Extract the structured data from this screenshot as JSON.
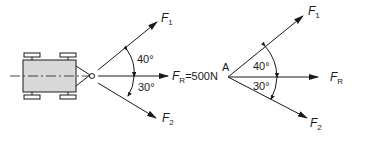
{
  "left_diagram": {
    "description": "Vehicle pulled by two forces",
    "forces": {
      "F1": {
        "label": "F",
        "sub": "1"
      },
      "F2": {
        "label": "F",
        "sub": "2"
      },
      "FR": {
        "label": "F",
        "sub": "R",
        "value": "=500N"
      }
    },
    "angles": {
      "upper": "40°",
      "lower": "30°"
    }
  },
  "right_diagram": {
    "point_label": "A",
    "forces": {
      "F1": {
        "label": "F",
        "sub": "1"
      },
      "F2": {
        "label": "F",
        "sub": "2"
      },
      "FR": {
        "label": "F",
        "sub": "R"
      }
    },
    "angles": {
      "upper": "40°",
      "lower": "30°"
    }
  },
  "colors": {
    "line": "#1a1a1a",
    "vehicle_fill": "#d9d9d9",
    "background": "#ffffff"
  }
}
